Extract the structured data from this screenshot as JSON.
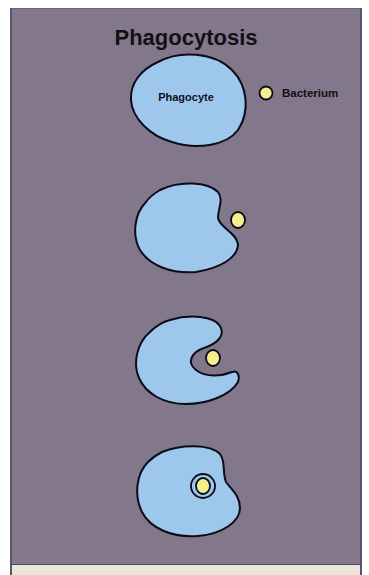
{
  "title": "Phagocytosis",
  "labels": {
    "phagocyte": "Phagocyte",
    "bacterium": "Bacterium"
  },
  "stages": [
    {
      "step": 1,
      "description": "Phagocyte approaches bacterium"
    },
    {
      "step": 2,
      "description": "Phagocyte begins to engulf bacterium"
    },
    {
      "step": 3,
      "description": "Pseudopods surround bacterium"
    },
    {
      "step": 4,
      "description": "Bacterium enclosed in phagosome"
    }
  ],
  "colors": {
    "background": "#83778c",
    "cell_fill": "#9dc8ec",
    "cell_stroke": "#0c0c18",
    "bacterium_fill": "#f4ee8c",
    "bottom_strip": "#ece6da"
  }
}
